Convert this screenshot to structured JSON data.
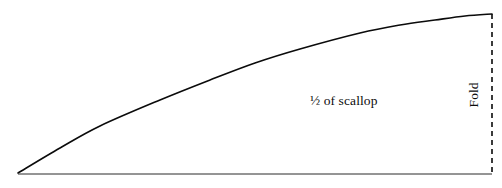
{
  "figure": {
    "kind": "line-diagram",
    "background_color": "#ffffff",
    "ink_color": "#0b0b0b",
    "width": 502,
    "height": 188
  },
  "labels": {
    "scallop": "½ of scallop",
    "fold": "Fold"
  },
  "chart_data": {
    "type": "line",
    "title": "",
    "subtitle": "",
    "xlabel": "",
    "ylabel": "",
    "grid": false,
    "legend": "none",
    "xlim": [
      0,
      502
    ],
    "ylim": [
      188,
      0
    ],
    "annotations": [
      {
        "text": "½ of scallop",
        "x": 347,
        "y": 102,
        "rotation": 0
      },
      {
        "text": "Fold",
        "x": 474,
        "y": 95,
        "rotation": -90
      }
    ],
    "series": [
      {
        "name": "scallop-curve",
        "style": "solid",
        "color": "#0b0b0b",
        "width": 1.6,
        "x": [
          18,
          60,
          100,
          160,
          210,
          255,
          300,
          360,
          400,
          435,
          465,
          492
        ],
        "y": [
          173,
          148,
          126,
          100,
          80,
          63,
          49,
          33,
          25,
          20,
          16,
          14
        ]
      },
      {
        "name": "baseline",
        "style": "solid",
        "color": "#2a2a2a",
        "width": 1.0,
        "x": [
          18,
          492
        ],
        "y": [
          174,
          174
        ]
      },
      {
        "name": "fold-line",
        "style": "dashed",
        "color": "#0b0b0b",
        "width": 1.6,
        "dash": [
          5,
          4
        ],
        "x": [
          492,
          492
        ],
        "y": [
          14,
          174
        ]
      }
    ]
  }
}
